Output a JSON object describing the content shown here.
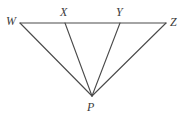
{
  "figure": {
    "name": "triangle-fan-wxyz-p",
    "background_color": "#ffffff",
    "stroke_color": "#4a4a4a",
    "label_color": "#3b3b3b",
    "stroke_width": 1,
    "labels": {
      "w": "W",
      "x": "X",
      "y": "Y",
      "z": "Z",
      "p": "P"
    },
    "points": {
      "w": {
        "x": 20,
        "y": 23
      },
      "x": {
        "x": 65,
        "y": 23
      },
      "y": {
        "x": 120,
        "y": 23
      },
      "z": {
        "x": 166,
        "y": 23
      },
      "p": {
        "x": 92,
        "y": 96
      }
    },
    "segments": [
      {
        "name": "segment-wz",
        "from": "w",
        "to": "z"
      },
      {
        "name": "segment-wp",
        "from": "w",
        "to": "p"
      },
      {
        "name": "segment-xp",
        "from": "x",
        "to": "p"
      },
      {
        "name": "segment-yp",
        "from": "y",
        "to": "p"
      },
      {
        "name": "segment-zp",
        "from": "z",
        "to": "p"
      }
    ],
    "label_positions": {
      "w": {
        "left": 6,
        "top": 15
      },
      "x": {
        "left": 60,
        "top": 6
      },
      "y": {
        "left": 116,
        "top": 6
      },
      "z": {
        "left": 170,
        "top": 16
      },
      "p": {
        "left": 87,
        "top": 101
      }
    }
  }
}
